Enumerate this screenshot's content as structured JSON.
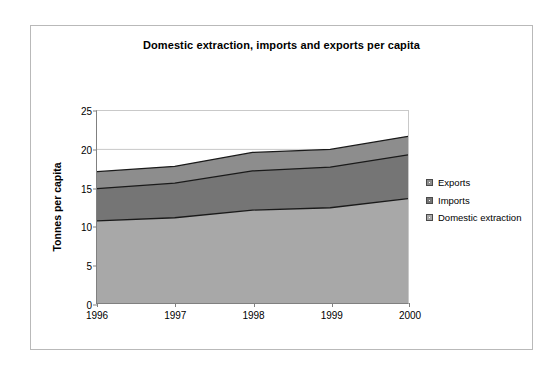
{
  "chart_data": {
    "type": "area",
    "title": "Domestic extraction, imports and exports per capita",
    "xlabel": "",
    "ylabel": "Tonnes per capita",
    "x": [
      "1996",
      "1997",
      "1998",
      "1999",
      "2000"
    ],
    "categories": [
      "1996",
      "1997",
      "1998",
      "1999",
      "2000"
    ],
    "stacked": true,
    "series": [
      {
        "name": "Domestic extraction",
        "values": [
          10.7,
          11.1,
          12.1,
          12.4,
          13.6
        ],
        "color": "#a8a8a8"
      },
      {
        "name": "Imports",
        "values": [
          4.2,
          4.5,
          5.1,
          5.3,
          5.7
        ],
        "color": "#757575"
      },
      {
        "name": "Exports",
        "values": [
          2.2,
          2.2,
          2.4,
          2.3,
          2.4
        ],
        "color": "#8d8d8d"
      }
    ],
    "cumulative": {
      "domestic_extraction": [
        10.7,
        11.1,
        12.1,
        12.4,
        13.6
      ],
      "plus_imports": [
        14.9,
        15.6,
        17.2,
        17.7,
        19.3
      ],
      "plus_exports": [
        17.1,
        17.8,
        19.6,
        20.0,
        21.7
      ]
    },
    "ylim": [
      0,
      25
    ],
    "y_ticks": [
      "0",
      "5",
      "10",
      "15",
      "20",
      "25"
    ],
    "y_tick_values": [
      0,
      5,
      10,
      15,
      20,
      25
    ],
    "gridlines": {
      "y": [
        20
      ],
      "color": "#c9c9c9"
    },
    "legend": {
      "position": "right",
      "entries": [
        {
          "label": "Exports",
          "color": "#8d8d8d"
        },
        {
          "label": "Imports",
          "color": "#757575"
        },
        {
          "label": "Domestic extraction",
          "color": "#a8a8a8"
        }
      ]
    },
    "colors": {
      "exports": "#8d8d8d",
      "imports": "#757575",
      "domestic_extraction": "#a8a8a8",
      "series_outline": "#1a1a1a",
      "axis": "#808080",
      "frame": "#b9b9b9",
      "background": "#ffffff"
    }
  }
}
